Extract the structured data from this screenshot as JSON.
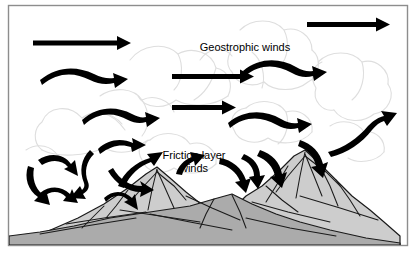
{
  "figure": {
    "title_alt": "Geostrophic and friction layer winds over mountains",
    "frame": {
      "x": 8,
      "y": 5,
      "width": 400,
      "height": 241,
      "border_color": "#8d8d8d",
      "background_color": "#ffffff"
    },
    "labels": [
      {
        "name": "geostrophic-winds-label",
        "lines": [
          "Geostrophic winds"
        ],
        "x": 245,
        "y": 48,
        "font_size": 11,
        "color": "#000000"
      },
      {
        "name": "friction-layer-winds-label",
        "lines": [
          "Friction layer",
          "winds"
        ],
        "x": 194,
        "y": 158,
        "font_size": 11,
        "color": "#000000"
      }
    ],
    "colors": {
      "arrow": "#000000",
      "cloud_outline": "#dedede",
      "mountain_fill_light": "#cfcfcf",
      "mountain_fill_dark": "#a6a6a6",
      "mountain_outline": "#1a1a1a",
      "frame_border": "#8d8d8d",
      "text": "#000000"
    },
    "wind_arrows": {
      "geostrophic_straight": [
        {
          "name": "arrow-geostrophic-1",
          "x1": 33,
          "y1": 43,
          "x2": 127,
          "y2": 43
        },
        {
          "name": "arrow-geostrophic-2",
          "x1": 307,
          "y1": 24,
          "x2": 385,
          "y2": 24
        },
        {
          "name": "arrow-geostrophic-3",
          "x1": 172,
          "y1": 76,
          "x2": 250,
          "y2": 76
        },
        {
          "name": "arrow-geostrophic-4",
          "x1": 172,
          "y1": 107,
          "x2": 232,
          "y2": 107
        }
      ],
      "wavy": [
        {
          "name": "arrow-wavy-1",
          "start_x": 42,
          "start_y": 78,
          "end_x": 120,
          "end_y": 76
        },
        {
          "name": "arrow-wavy-2",
          "start_x": 83,
          "start_y": 118,
          "end_x": 148,
          "end_y": 114
        },
        {
          "name": "arrow-wavy-3",
          "start_x": 245,
          "start_y": 69,
          "end_x": 320,
          "end_y": 70
        },
        {
          "name": "arrow-wavy-4",
          "start_x": 230,
          "start_y": 121,
          "end_x": 300,
          "end_y": 124
        },
        {
          "name": "arrow-wavy-5",
          "start_x": 100,
          "start_y": 147,
          "end_x": 145,
          "end_y": 142
        },
        {
          "name": "arrow-wavy-6",
          "start_x": 330,
          "start_y": 148,
          "end_x": 394,
          "end_y": 118
        }
      ],
      "turbulent": [
        {
          "name": "arrow-turbulent-1",
          "start_x": 30,
          "start_y": 164,
          "end_x": 52,
          "end_y": 200
        },
        {
          "name": "arrow-turbulent-2",
          "start_x": 43,
          "start_y": 191,
          "end_x": 70,
          "end_y": 207
        },
        {
          "name": "arrow-turbulent-3",
          "start_x": 40,
          "start_y": 158,
          "end_x": 72,
          "end_y": 176
        },
        {
          "name": "arrow-turbulent-4",
          "start_x": 96,
          "start_y": 155,
          "end_x": 78,
          "end_y": 192
        },
        {
          "name": "arrow-turbulent-5",
          "start_x": 115,
          "start_y": 170,
          "end_x": 148,
          "end_y": 188
        },
        {
          "name": "arrow-turbulent-6",
          "start_x": 106,
          "start_y": 196,
          "end_x": 136,
          "end_y": 212
        },
        {
          "name": "arrow-turbulent-7",
          "start_x": 120,
          "start_y": 184,
          "end_x": 160,
          "end_y": 164
        },
        {
          "name": "arrow-turbulent-8",
          "start_x": 178,
          "start_y": 172,
          "end_x": 194,
          "end_y": 160
        },
        {
          "name": "arrow-turbulent-9",
          "start_x": 222,
          "start_y": 160,
          "end_x": 248,
          "end_y": 180
        },
        {
          "name": "arrow-turbulent-10",
          "start_x": 246,
          "start_y": 155,
          "end_x": 262,
          "end_y": 178
        },
        {
          "name": "arrow-turbulent-11",
          "start_x": 262,
          "start_y": 152,
          "end_x": 280,
          "end_y": 178
        }
      ]
    },
    "mountains": [
      {
        "name": "mountain-left",
        "peak_x": 152,
        "peak_y": 168,
        "base_y": 240,
        "fill": "#cfcfcf"
      },
      {
        "name": "mountain-right",
        "peak_x": 305,
        "peak_y": 152,
        "base_y": 240,
        "fill": "#cfcfcf"
      },
      {
        "name": "mountain-foreground",
        "peak_x": 232,
        "peak_y": 196,
        "base_y": 240,
        "fill": "#b4b4b4"
      }
    ],
    "clouds": {
      "name": "cloud-layer",
      "description": "Faint cumulus cloud outlines filling the upper portion",
      "outline_color": "#dedede"
    }
  }
}
